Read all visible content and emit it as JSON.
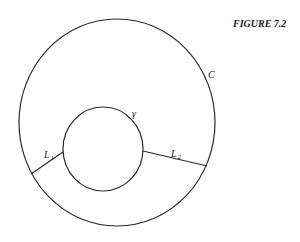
{
  "figure": {
    "title": "FIGURE 7.2",
    "stroke_color": "#2a2a2a",
    "background": "#ffffff"
  },
  "shapes": {
    "outer_curve": {
      "label": "C",
      "cx": 117,
      "cy": 122.5,
      "rx": 98,
      "ry": 103.5
    },
    "inner_curve": {
      "label": "γ",
      "cx": 103,
      "cy": 149,
      "rx": 40,
      "ry": 42
    },
    "segments": [
      {
        "label": "L",
        "subscript": "1",
        "x1": 63,
        "y1": 152,
        "x2": 31,
        "y2": 174
      },
      {
        "label": "L",
        "subscript": "2",
        "x1": 143,
        "y1": 151,
        "x2": 207,
        "y2": 166
      }
    ]
  }
}
